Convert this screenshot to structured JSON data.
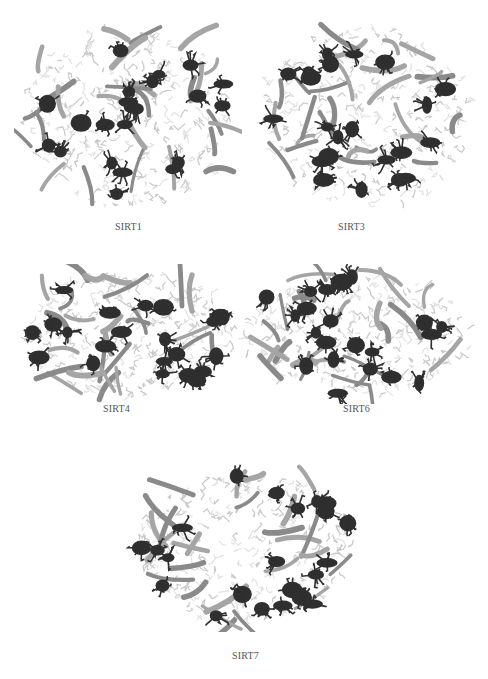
{
  "figure": {
    "panels": [
      {
        "id": "sirt1",
        "label": "SIRT1",
        "x": 14,
        "y": 14,
        "w": 228,
        "h": 206,
        "label_x": 115,
        "label_y": 221,
        "seed": 11,
        "shape": "round"
      },
      {
        "id": "sirt3",
        "label": "SIRT3",
        "x": 252,
        "y": 14,
        "w": 228,
        "h": 206,
        "label_x": 338,
        "label_y": 221,
        "seed": 23,
        "shape": "wide"
      },
      {
        "id": "sirt4",
        "label": "SIRT4",
        "x": 14,
        "y": 264,
        "w": 228,
        "h": 140,
        "label_x": 103,
        "label_y": 403,
        "seed": 37,
        "shape": "wide"
      },
      {
        "id": "sirt6",
        "label": "SIRT6",
        "x": 232,
        "y": 264,
        "w": 248,
        "h": 140,
        "label_x": 343,
        "label_y": 403,
        "seed": 41,
        "shape": "wide"
      },
      {
        "id": "sirt7",
        "label": "SIRT7",
        "x": 126,
        "y": 462,
        "w": 238,
        "h": 170,
        "label_x": 232,
        "label_y": 650,
        "seed": 53,
        "shape": "wide"
      }
    ],
    "colors": {
      "dark": "#2f2f2f",
      "mid": "#8a8a8a",
      "light": "#c9c9c9",
      "pale": "#e2e2e2",
      "label": "#555555"
    }
  }
}
